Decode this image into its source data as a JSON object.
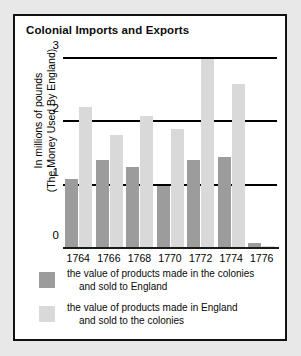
{
  "chart_data": {
    "type": "bar",
    "title": "Colonial Imports and Exports",
    "xlabel": "",
    "ylabel": "In millions of pounds (The Money Used By England)",
    "ylabel_line1": "In millions of pounds",
    "ylabel_line2": "(The Money Used By England)",
    "categories": [
      "1764",
      "1766",
      "1768",
      "1770",
      "1772",
      "1774",
      "1776"
    ],
    "series": [
      {
        "name": "the value of products made in the colonies and sold to England",
        "color": "#9c9c9c",
        "values": [
          1.1,
          1.4,
          1.3,
          1.0,
          1.4,
          1.45,
          0.1
        ]
      },
      {
        "name": "the value of products made in England and sold to the colonies",
        "color": "#d9d9d9",
        "values": [
          2.25,
          1.8,
          2.1,
          1.9,
          3.0,
          2.6,
          0.05
        ]
      }
    ],
    "ylim": [
      0,
      3
    ],
    "yticks": [
      "0",
      "1",
      "2",
      "3"
    ],
    "grid": true,
    "legend_position": "bottom"
  },
  "legend": {
    "entries": [
      {
        "color": "#9c9c9c",
        "line1": "the value of products made in the colonies",
        "line2": "and sold to England"
      },
      {
        "color": "#d9d9d9",
        "line1": "the value of products made in England",
        "line2": "and sold to the colonies"
      }
    ]
  }
}
